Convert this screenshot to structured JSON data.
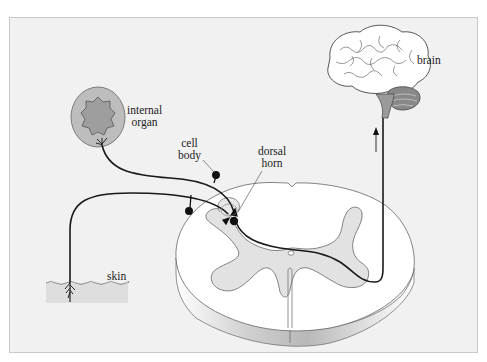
{
  "diagram": {
    "type": "anatomical-pathway",
    "labels": {
      "internal_organ_line1": "internal",
      "internal_organ_line2": "organ",
      "cell_body_line1": "cell",
      "cell_body_line2": "body",
      "dorsal_horn_line1": "dorsal",
      "dorsal_horn_line2": "horn",
      "brain": "brain",
      "skin": "skin"
    },
    "colors": {
      "background": "#f1f1f1",
      "frame_border": "#c9c9c9",
      "organ_outer": "#bdbdbd",
      "organ_inner": "#9e9e9e",
      "grey_matter": "#e2e2e2",
      "white_matter": "#ffffff",
      "nerve_fiber": "#1a1a1a",
      "skin_layer": "#dedede"
    },
    "arrow_direction": "up"
  }
}
